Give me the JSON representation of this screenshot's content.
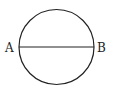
{
  "diagram": {
    "type": "circle-with-diameter",
    "points": [
      {
        "label": "A"
      },
      {
        "label": "B"
      }
    ],
    "segment": "AB",
    "stroke_color": "#222222"
  }
}
